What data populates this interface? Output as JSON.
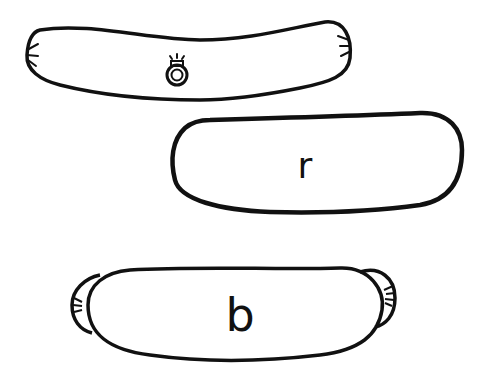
{
  "diagram": {
    "shapes": [
      {
        "id": "sausage",
        "description": "curved sausage shape with ring",
        "icon": "ring-icon",
        "label": ""
      },
      {
        "id": "roll",
        "description": "rounded roll shape",
        "label": "r"
      },
      {
        "id": "bun",
        "description": "bun shape with end caps",
        "label": "b"
      }
    ]
  },
  "colors": {
    "stroke": "#111111",
    "background": "#ffffff"
  }
}
